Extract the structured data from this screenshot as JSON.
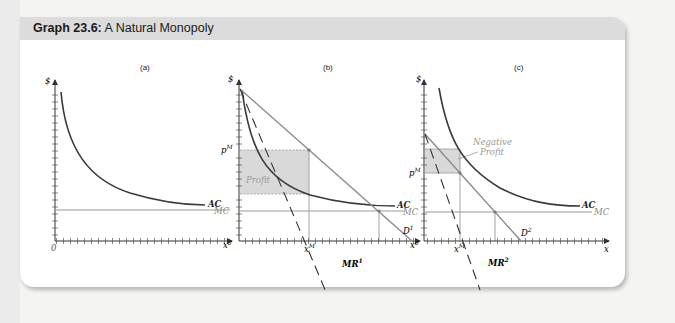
{
  "figure": {
    "title_bold": "Graph 23.6:",
    "title_rest": " A Natural Monopoly",
    "panels": [
      {
        "label": "(a)",
        "y_axis": "$",
        "origin": "0",
        "x_axis": "",
        "curves": [
          "AC",
          "MC"
        ]
      },
      {
        "label": "(b)",
        "y_axis": "$",
        "origin": "0",
        "x_axis": "x",
        "price_label": "p",
        "price_sup": "M",
        "qty_label": "x",
        "qty_sup": "M",
        "shaded_label": "Profit",
        "curves": [
          "AC",
          "MC"
        ],
        "demand_label": "D",
        "demand_sup": "1",
        "mr_label": "MR",
        "mr_sup": "1"
      },
      {
        "label": "(c)",
        "y_axis": "$",
        "origin": "0",
        "x_axis": "x",
        "price_label": "p",
        "price_sup": "M",
        "qty_label": "x",
        "qty_sup": "M",
        "shaded_label_1": "Negative",
        "shaded_label_2": "Profit",
        "curves": [
          "AC",
          "MC"
        ],
        "demand_label": "D",
        "demand_sup": "2",
        "mr_label": "MR",
        "mr_sup": "2"
      }
    ],
    "colors": {
      "header": "#dcdcdc",
      "ac": "#3a3a3a",
      "mc": "#9a9a9a",
      "demand": "#8a8a8a",
      "shade": "#d9d9d9",
      "axis": "#333333"
    }
  }
}
